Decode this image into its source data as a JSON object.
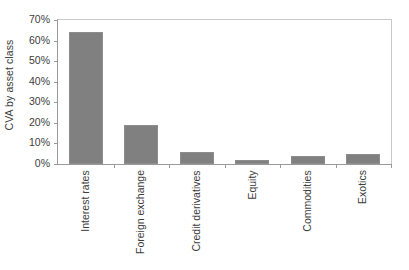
{
  "chart_data": {
    "type": "bar",
    "title": "",
    "subtitle": "",
    "xlabel": "",
    "ylabel": "CVA by asset class",
    "categories": [
      "Interest rates",
      "Foreign exchange",
      "Credit derivatives",
      "Equity",
      "Commodities",
      "Exotics"
    ],
    "values": [
      64,
      19,
      6,
      2,
      4,
      5
    ],
    "value_unit": "%",
    "ylim": [
      0,
      70
    ],
    "ytick_step": 10,
    "ytick_labels": [
      "0%",
      "10%",
      "20%",
      "30%",
      "40%",
      "50%",
      "60%",
      "70%"
    ],
    "ytick_values": [
      0,
      10,
      20,
      30,
      40,
      50,
      60,
      70
    ],
    "grid": false,
    "legend": false,
    "legend_position": "none",
    "orientation": "vertical",
    "bar_color": "#808080",
    "bar_border_color": "#8d8d8d",
    "axis_color": "#9a9a9a",
    "plot_border_color": "#c9c9c9",
    "text_color": "#3c3c3c",
    "xtick_label_rotation": 90,
    "ylabel_rotation": 90,
    "series": [
      {
        "name": "CVA by asset class",
        "values": [
          64,
          19,
          6,
          2,
          4,
          5
        ]
      }
    ]
  }
}
